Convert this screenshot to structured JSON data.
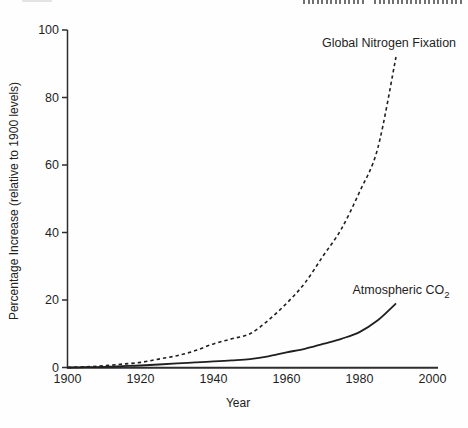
{
  "chart_data": {
    "type": "line",
    "title": "",
    "xlabel": "Year",
    "ylabel": "Percentage Increase (relative to 1900 levels)",
    "xlim": [
      1900,
      2000
    ],
    "ylim": [
      0,
      100
    ],
    "x_ticks": [
      1900,
      1920,
      1940,
      1960,
      1980,
      2000
    ],
    "y_ticks": [
      0,
      20,
      40,
      60,
      80,
      100
    ],
    "grid": false,
    "legend_position": "inline-annotations",
    "axis_color": "#2e2e2e",
    "series": [
      {
        "name": "Global Nitrogen Fixation",
        "style": "dashed",
        "color": "#1f1f1f",
        "x": [
          1900,
          1905,
          1910,
          1915,
          1920,
          1925,
          1930,
          1935,
          1940,
          1945,
          1950,
          1955,
          1960,
          1965,
          1970,
          1975,
          1980,
          1985,
          1990
        ],
        "values": [
          0,
          0.2,
          0.5,
          1,
          1.5,
          2.5,
          3.5,
          5,
          7,
          8.5,
          10,
          14,
          19,
          25,
          33,
          41,
          52,
          65,
          92
        ]
      },
      {
        "name": "Atmospheric CO2",
        "style": "solid",
        "color": "#1f1f1f",
        "x": [
          1900,
          1905,
          1910,
          1915,
          1920,
          1925,
          1930,
          1935,
          1940,
          1945,
          1950,
          1955,
          1960,
          1965,
          1970,
          1975,
          1980,
          1985,
          1990
        ],
        "values": [
          0,
          0.1,
          0.2,
          0.4,
          0.6,
          0.9,
          1.2,
          1.5,
          1.8,
          2.1,
          2.5,
          3.3,
          4.5,
          5.5,
          7,
          8.5,
          10.5,
          14,
          19
        ]
      }
    ],
    "annotations": [
      {
        "text": "Global Nitrogen Fixation"
      },
      {
        "text": "Atmospheric CO",
        "sub": "2"
      }
    ]
  }
}
